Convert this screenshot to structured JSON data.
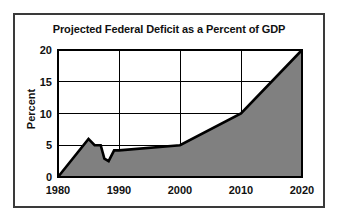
{
  "chart_data": {
    "type": "area",
    "title": "Projected Federal Deficit as a Percent of GDP",
    "xlabel": "",
    "ylabel": "Percent",
    "xlim": [
      1980,
      2020
    ],
    "ylim": [
      0,
      20
    ],
    "grid": true,
    "legend": "none",
    "fill_color": "#808080",
    "line_color": "#000000",
    "x_ticks": [
      "1980",
      "1990",
      "2000",
      "2010",
      "2020"
    ],
    "x_tick_values": [
      1980,
      1990,
      2000,
      2010,
      2020
    ],
    "y_ticks": [
      "0",
      "5",
      "10",
      "15",
      "20"
    ],
    "y_tick_values": [
      0,
      5,
      10,
      15,
      20
    ],
    "x": [
      1980,
      1985,
      1986,
      1987,
      1987.6,
      1988.3,
      1989.2,
      1990,
      2000,
      2010,
      2020
    ],
    "values": [
      0,
      6.0,
      5.0,
      5.0,
      2.9,
      2.5,
      4.2,
      4.2,
      5.0,
      10.0,
      20.0
    ]
  }
}
